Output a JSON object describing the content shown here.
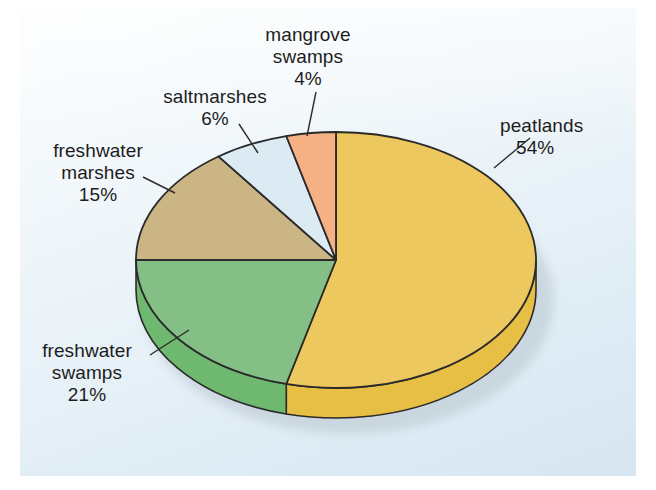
{
  "figure": {
    "background_color": "#ffffff",
    "panel_color": "#e6f0f7"
  },
  "chart_data": {
    "type": "pie",
    "title": "",
    "subtitle": "",
    "xlabel": "",
    "ylabel": "",
    "unit": "%",
    "legend_position": "none",
    "grid": false,
    "style": "3d-pie-with-depth",
    "start_angle_deg": 0,
    "direction": "clockwise",
    "categories": [
      "peatlands",
      "freshwater swamps",
      "freshwater marshes",
      "saltmarshes",
      "mangrove swamps"
    ],
    "values": [
      54,
      21,
      15,
      6,
      4
    ],
    "labels": [
      "peatlands 54%",
      "freshwater swamps 21%",
      "freshwater marshes 15%",
      "saltmarshes 6%",
      "mangrove swamps 4%"
    ],
    "colors": [
      "#edc85e",
      "#84c085",
      "#cbb584",
      "#dceaf3",
      "#f5b183"
    ],
    "side_colors": [
      "#e7bf45",
      "#6fb86f",
      "#bda16a",
      "#c9dce8",
      "#ef9c66"
    ],
    "slices": [
      {
        "name": "peatlands",
        "value": 54,
        "color": "#edc85e",
        "side_color": "#e7bf45",
        "label_lines": [
          "peatlands",
          "54%"
        ]
      },
      {
        "name": "freshwater swamps",
        "value": 21,
        "color": "#84c085",
        "side_color": "#6fb86f",
        "label_lines": [
          "freshwater",
          "swamps",
          "21%"
        ]
      },
      {
        "name": "freshwater marshes",
        "value": 15,
        "color": "#cbb584",
        "side_color": "#bda16a",
        "label_lines": [
          "freshwater",
          "marshes",
          "15%"
        ]
      },
      {
        "name": "saltmarshes",
        "value": 6,
        "color": "#dceaf3",
        "side_color": "#c9dce8",
        "label_lines": [
          "saltmarshes",
          "6%"
        ]
      },
      {
        "name": "mangrove swamps",
        "value": 4,
        "color": "#f5b183",
        "side_color": "#ef9c66",
        "label_lines": [
          "mangrove",
          "swamps",
          "4%"
        ]
      }
    ]
  },
  "labels": {
    "peatlands": {
      "name": "peatlands",
      "pct": "54%"
    },
    "freshwater_swamps": {
      "l1": "freshwater",
      "l2": "swamps",
      "pct": "21%"
    },
    "freshwater_marshes": {
      "l1": "freshwater",
      "l2": "marshes",
      "pct": "15%"
    },
    "saltmarshes": {
      "name": "saltmarshes",
      "pct": "6%"
    },
    "mangrove_swamps": {
      "l1": "mangrove",
      "l2": "swamps",
      "pct": "4%"
    }
  }
}
